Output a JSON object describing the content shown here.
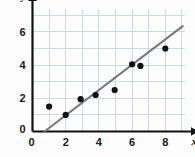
{
  "chart_data": {
    "type": "scatter",
    "title": "",
    "xlabel": "x",
    "ylabel": "y",
    "xlim": [
      0,
      9.2
    ],
    "ylim": [
      0,
      7.4
    ],
    "grid": true,
    "grid_step_x": 1,
    "grid_step_y": 1,
    "legend": "none",
    "x_ticks": [
      0,
      2,
      4,
      6,
      8
    ],
    "x_tick_labels": [
      "0",
      "2",
      "4",
      "6",
      "8"
    ],
    "y_ticks": [
      0,
      2,
      4,
      6
    ],
    "y_tick_labels": [
      "0",
      "2",
      "4",
      "6"
    ],
    "origin_label": "0",
    "points": [
      {
        "x": 1.0,
        "y": 1.5
      },
      {
        "x": 2.0,
        "y": 1.0
      },
      {
        "x": 2.9,
        "y": 1.95
      },
      {
        "x": 3.8,
        "y": 2.2
      },
      {
        "x": 4.95,
        "y": 2.5
      },
      {
        "x": 6.0,
        "y": 4.05
      },
      {
        "x": 6.5,
        "y": 3.95
      },
      {
        "x": 8.0,
        "y": 5.0
      }
    ],
    "trend_line": {
      "name": "line of best fit",
      "x_start": 0.72,
      "y_start": 0.0,
      "x_end": 9.05,
      "y_end": 6.35,
      "slope": 0.763,
      "intercept": -0.549,
      "color": "#7a7a7a"
    },
    "colors": {
      "point": "#111111",
      "axis": "#111111",
      "grid": "#ccd9e8",
      "trend": "#7a7a7a",
      "background": "#fdfdfd"
    }
  }
}
